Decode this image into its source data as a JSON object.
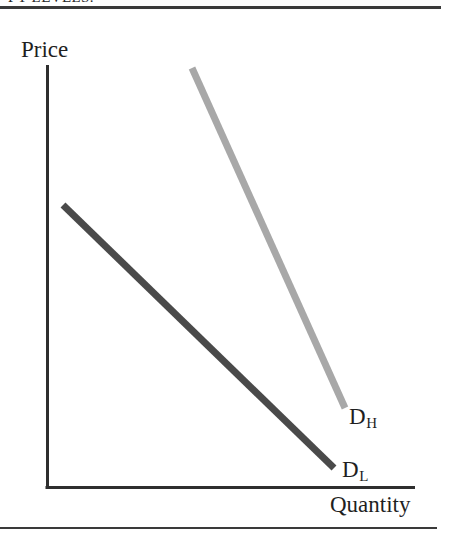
{
  "page": {
    "caption_clipped": "PY LEVELS."
  },
  "figure": {
    "axes": {
      "y_label": "Price",
      "x_label": "Quantity"
    },
    "curves": [
      {
        "id": "D_H",
        "label_main": "D",
        "label_sub": "H",
        "color": "#a8a8a8",
        "description": "high demand curve"
      },
      {
        "id": "D_L",
        "label_main": "D",
        "label_sub": "L",
        "color": "#4a4a4a",
        "description": "low demand curve"
      }
    ]
  },
  "chart_data": {
    "type": "line",
    "title": "",
    "xlabel": "Quantity",
    "ylabel": "Price",
    "grid": false,
    "legend": "inline-end-labels",
    "axis_origin_px": [
      47,
      488
    ],
    "axis_extent_px": {
      "y_top": 65,
      "x_right": 415
    },
    "xlim": [
      0,
      1
    ],
    "ylim": [
      0,
      1
    ],
    "series": [
      {
        "name": "D_H",
        "color": "#a8a8a8",
        "linewidth": 7,
        "points_px": [
          [
            192,
            68
          ],
          [
            345,
            408
          ]
        ],
        "x": [
          0.394,
          0.81
        ],
        "y": [
          0.993,
          0.189
        ],
        "label": "D",
        "label_subscript": "H"
      },
      {
        "name": "D_L",
        "color": "#4a4a4a",
        "linewidth": 7,
        "points_px": [
          [
            63,
            205
          ],
          [
            334,
            468
          ]
        ],
        "x": [
          0.043,
          0.78
        ],
        "y": [
          0.669,
          0.047
        ],
        "label": "D",
        "label_subscript": "L"
      }
    ],
    "annotations": [
      {
        "text": "Price",
        "position_px": [
          21,
          37
        ],
        "role": "y-axis-title"
      },
      {
        "text": "Quantity",
        "position_px": [
          330,
          492
        ],
        "role": "x-axis-title"
      },
      {
        "text": "D_H",
        "position_px": [
          349,
          404
        ],
        "role": "curve-label"
      },
      {
        "text": "D_L",
        "position_px": [
          342,
          457
        ],
        "role": "curve-label"
      }
    ]
  }
}
